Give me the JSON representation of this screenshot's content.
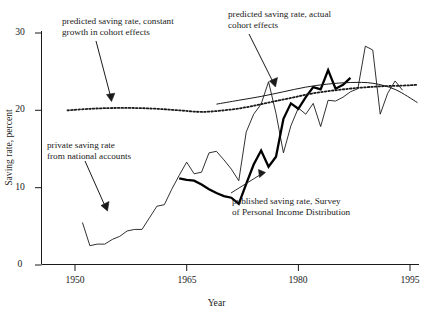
{
  "chart_data": {
    "type": "line",
    "title": "",
    "xlabel": "Year",
    "ylabel": "Saving rate, percent",
    "xlim": [
      1948,
      1996
    ],
    "ylim": [
      0,
      31
    ],
    "xticks": [
      1950,
      1965,
      1980,
      1995
    ],
    "yticks": [
      0,
      10,
      20,
      30
    ],
    "grid": false,
    "legend_position": "inline-annotations",
    "annotations": [
      {
        "id": "constant-growth",
        "text": "predicted saving rate, constant\ngrowth in cohort effects",
        "points_to_series": "predicted saving rate, constant growth in cohort effects"
      },
      {
        "id": "actual-cohort",
        "text": "predicted saving rate, actual\ncohort effects",
        "points_to_series": "predicted saving rate, actual cohort effects"
      },
      {
        "id": "private-saving",
        "text": "private saving rate\nfrom national accounts",
        "points_to_series": "private saving rate from national accounts"
      },
      {
        "id": "published-survey",
        "text": "published saving rate, Survey\nof Personal Income Distribution",
        "points_to_series": "published saving rate, Survey of Personal Income Distribution"
      }
    ],
    "series": [
      {
        "name": "private saving rate from national accounts",
        "style": "thin-solid",
        "color": "#1a1a1a",
        "x": [
          1951,
          1952,
          1953,
          1954,
          1955,
          1956,
          1957,
          1958,
          1959,
          1960,
          1961,
          1962,
          1963,
          1964,
          1965,
          1966,
          1967,
          1968,
          1969,
          1970,
          1971,
          1972,
          1973,
          1974,
          1975,
          1976,
          1977,
          1978,
          1979,
          1980,
          1981,
          1982,
          1983,
          1984,
          1985,
          1986,
          1987,
          1988,
          1989,
          1990,
          1991,
          1992,
          1993,
          1994
        ],
        "y": [
          5.5,
          2.5,
          2.7,
          2.7,
          3.3,
          3.7,
          4.4,
          4.6,
          4.6,
          6.1,
          7.6,
          7.8,
          9.8,
          11.6,
          13.3,
          11.8,
          12.0,
          14.5,
          14.7,
          13.6,
          12.4,
          10.9,
          17.2,
          19.5,
          20.8,
          23.7,
          19.6,
          14.5,
          18.0,
          20.3,
          19.5,
          20.9,
          17.9,
          21.3,
          21.2,
          21.7,
          22.4,
          22.8,
          28.3,
          27.8,
          19.5,
          22.2,
          23.8,
          22.6
        ]
      },
      {
        "name": "published saving rate, Survey of Personal Income Distribution",
        "style": "bold-solid",
        "color": "#000000",
        "x": [
          1964,
          1965,
          1966,
          1967,
          1968,
          1969,
          1970,
          1971,
          1972,
          1973,
          1974,
          1975,
          1976,
          1977,
          1978,
          1979,
          1980,
          1981,
          1982,
          1983,
          1984,
          1985,
          1986,
          1987
        ],
        "y": [
          11.2,
          11.0,
          10.9,
          10.4,
          9.8,
          9.3,
          8.9,
          8.7,
          7.9,
          10.5,
          13.0,
          14.8,
          12.7,
          14.0,
          18.9,
          20.9,
          20.2,
          21.7,
          23.0,
          22.7,
          25.2,
          22.8,
          23.3,
          24.2
        ]
      },
      {
        "name": "predicted saving rate, actual cohort effects",
        "style": "thin-smooth",
        "color": "#1a1a1a",
        "x": [
          1969,
          1972,
          1975,
          1978,
          1981,
          1984,
          1987,
          1990,
          1993,
          1996
        ],
        "y": [
          20.8,
          21.3,
          21.8,
          22.4,
          23.0,
          23.4,
          23.6,
          23.5,
          22.7,
          21.0
        ]
      },
      {
        "name": "predicted saving rate, constant growth in cohort effects",
        "style": "dotted",
        "color": "#1a1a1a",
        "x": [
          1949,
          1952,
          1955,
          1958,
          1961,
          1964,
          1967,
          1970,
          1973,
          1976,
          1979,
          1982,
          1985,
          1988,
          1991,
          1994,
          1996
        ],
        "y": [
          20.0,
          20.2,
          20.3,
          20.3,
          20.2,
          20.0,
          19.8,
          20.0,
          20.4,
          21.0,
          21.6,
          22.2,
          22.6,
          22.9,
          23.1,
          23.2,
          23.3
        ]
      }
    ]
  },
  "axes": {
    "x_title": "Year",
    "y_title": "Saving rate, percent",
    "x_tick_labels": [
      "1950",
      "1965",
      "1980",
      "1995"
    ],
    "y_tick_labels": [
      "0",
      "10",
      "20",
      "30"
    ]
  },
  "annotation_text": {
    "constant_growth": "predicted saving rate, constant\ngrowth in cohort effects",
    "actual_cohort": "predicted saving rate, actual\ncohort effects",
    "private_saving": "private saving rate\nfrom national accounts",
    "published_survey": "published saving rate, Survey\nof Personal Income Distribution"
  },
  "colors": {
    "ink": "#1a1a1a",
    "background": "#ffffff"
  }
}
